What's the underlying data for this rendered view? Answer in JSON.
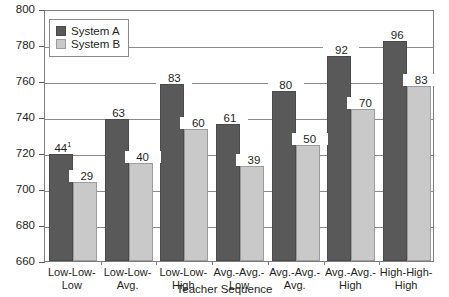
{
  "chart_data": {
    "type": "bar",
    "title": "",
    "xlabel": "Teacher Sequence",
    "ylabel": "",
    "ylim": [
      660,
      800
    ],
    "yticks": [
      660,
      680,
      700,
      720,
      740,
      760,
      780,
      800
    ],
    "grid": true,
    "legend_position": "top-left",
    "categories": [
      "Low-Low-\nLow",
      "Low-Low-\nAvg.",
      "Low-Low-\nHigh",
      "Avg.-Avg.-\nLow",
      "Avg.-Avg.-\nAvg.",
      "Avg.-Avg.-\nHigh",
      "High-High-\nHigh"
    ],
    "series": [
      {
        "name": "System A",
        "color": "#595959",
        "values": [
          719.5,
          739.0,
          758.5,
          736.0,
          754.5,
          774.0,
          782.0
        ],
        "labels": [
          "44",
          "63",
          "83",
          "61",
          "80",
          "92",
          "96"
        ],
        "label_superscripts": [
          "1",
          "",
          "",
          "",
          "",
          "",
          ""
        ]
      },
      {
        "name": "System B",
        "color": "#c9c9c9",
        "values": [
          704.0,
          714.5,
          733.5,
          713.0,
          724.5,
          744.5,
          757.5
        ],
        "labels": [
          "29",
          "40",
          "60",
          "39",
          "50",
          "70",
          "83"
        ],
        "label_superscripts": [
          "",
          "",
          "",
          "",
          "",
          "",
          ""
        ]
      }
    ]
  },
  "axis": {
    "y_tick_labels": [
      "800",
      "780",
      "760",
      "740",
      "720",
      "700",
      "680",
      "660"
    ],
    "x_title": "Teacher Sequence"
  },
  "legend": {
    "items": [
      {
        "label": "System A"
      },
      {
        "label": "System B"
      }
    ]
  }
}
